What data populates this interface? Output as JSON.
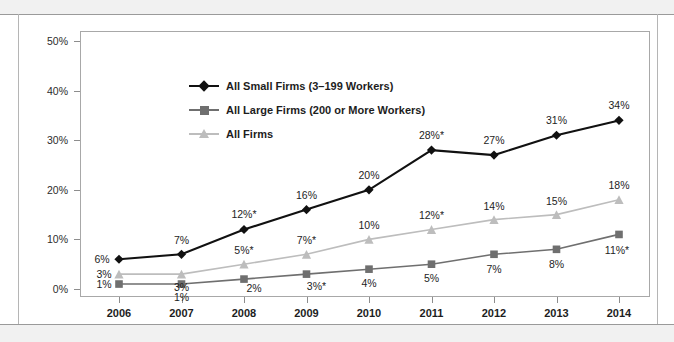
{
  "page": {
    "band_color": "#f1f1f1",
    "background": "#ffffff"
  },
  "legend": {
    "position": "inside-top-left",
    "items": [
      {
        "label": "All Small Firms (3–199 Workers)",
        "color": "#111111",
        "marker": "diamond"
      },
      {
        "label": "All Large Firms (200 or More Workers)",
        "color": "#6f6f6f",
        "marker": "square"
      },
      {
        "label": "All Firms",
        "color": "#bdbdbd",
        "marker": "triangle"
      }
    ]
  },
  "chart_data": {
    "type": "line",
    "title": "",
    "subtitle": "",
    "xlabel": "",
    "ylabel": "",
    "categories": [
      "2006",
      "2007",
      "2008",
      "2009",
      "2010",
      "2011",
      "2012",
      "2013",
      "2014"
    ],
    "x": [
      2006,
      2007,
      2008,
      2009,
      2010,
      2011,
      2012,
      2013,
      2014
    ],
    "ylim": [
      0,
      50
    ],
    "yticks": [
      0,
      10,
      20,
      30,
      40,
      50
    ],
    "ytick_labels": [
      "0%",
      "10%",
      "20%",
      "30%",
      "40%",
      "50%"
    ],
    "grid": false,
    "legend_position": "inside-top-left",
    "series": [
      {
        "name": "All Small Firms (3–199 Workers)",
        "color": "#111111",
        "marker": "diamond",
        "values": [
          6,
          7,
          12,
          16,
          20,
          28,
          27,
          31,
          34
        ],
        "point_labels": [
          "6%",
          "7%",
          "12%*",
          "16%",
          "20%",
          "28%*",
          "27%",
          "31%",
          "34%"
        ]
      },
      {
        "name": "All Large Firms (200 or More Workers)",
        "color": "#6f6f6f",
        "marker": "square",
        "values": [
          1,
          1,
          2,
          3,
          4,
          5,
          7,
          8,
          11
        ],
        "point_labels": [
          "1%",
          "1%",
          "2%",
          "3%*",
          "4%",
          "5%",
          "7%",
          "8%",
          "11%*"
        ]
      },
      {
        "name": "All Firms",
        "color": "#bdbdbd",
        "marker": "triangle",
        "values": [
          3,
          3,
          5,
          7,
          10,
          12,
          14,
          15,
          18
        ],
        "point_labels": [
          "3%",
          "3%",
          "5%*",
          "7%*",
          "10%",
          "12%*",
          "14%",
          "15%",
          "18%"
        ]
      }
    ]
  }
}
